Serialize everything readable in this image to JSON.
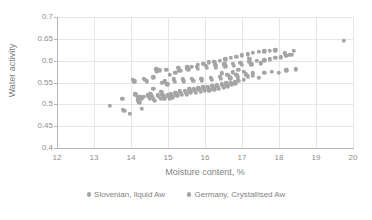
{
  "chart_data": {
    "type": "scatter",
    "title": "",
    "xlabel": "Moisture content, %",
    "ylabel": "Water activity",
    "xlim": [
      12,
      20
    ],
    "ylim": [
      0.4,
      0.7
    ],
    "xticks": [
      12,
      13,
      14,
      15,
      16,
      17,
      18,
      19,
      20
    ],
    "yticks": [
      0.4,
      0.45,
      0.5,
      0.55,
      0.6,
      0.65,
      0.7
    ],
    "xtick_labels": [
      "12",
      "13",
      "14",
      "15",
      "16",
      "17",
      "18",
      "19",
      "20"
    ],
    "ytick_labels": [
      "0.4",
      "0.45",
      "0.5",
      "0.55",
      "0.6",
      "0.65",
      "0.7"
    ],
    "grid": true,
    "grid_axes": "both",
    "legend_position": "bottom",
    "marker_color": "#a5a5a5",
    "marker_size": 4.4,
    "series": [
      {
        "name": "Slovenian, liquid Aw",
        "color": "#a5a5a5",
        "points": [
          [
            13.42,
            0.497
          ],
          [
            13.76,
            0.512
          ],
          [
            13.78,
            0.488
          ],
          [
            13.82,
            0.485
          ],
          [
            13.97,
            0.479
          ],
          [
            14.05,
            0.556
          ],
          [
            14.08,
            0.552
          ],
          [
            14.12,
            0.523
          ],
          [
            14.16,
            0.519
          ],
          [
            14.18,
            0.513
          ],
          [
            14.2,
            0.509
          ],
          [
            14.22,
            0.505
          ],
          [
            14.25,
            0.516
          ],
          [
            14.28,
            0.512
          ],
          [
            14.3,
            0.49
          ],
          [
            14.34,
            0.517
          ],
          [
            14.38,
            0.556
          ],
          [
            14.42,
            0.553
          ],
          [
            14.45,
            0.521
          ],
          [
            14.48,
            0.517
          ],
          [
            14.5,
            0.513
          ],
          [
            14.52,
            0.524
          ],
          [
            14.55,
            0.519
          ],
          [
            14.58,
            0.515
          ],
          [
            14.6,
            0.535
          ],
          [
            14.62,
            0.511
          ],
          [
            14.65,
            0.508
          ],
          [
            14.68,
            0.58
          ],
          [
            14.7,
            0.575
          ],
          [
            14.72,
            0.521
          ],
          [
            14.75,
            0.517
          ],
          [
            14.78,
            0.578
          ],
          [
            14.8,
            0.513
          ],
          [
            14.82,
            0.528
          ],
          [
            14.85,
            0.522
          ],
          [
            14.88,
            0.518
          ],
          [
            14.9,
            0.514
          ],
          [
            14.92,
            0.553
          ],
          [
            14.95,
            0.579
          ],
          [
            14.98,
            0.546
          ],
          [
            15.0,
            0.521
          ],
          [
            15.02,
            0.517
          ],
          [
            15.05,
            0.513
          ],
          [
            15.08,
            0.524
          ],
          [
            15.1,
            0.52
          ],
          [
            15.12,
            0.516
          ],
          [
            15.15,
            0.557
          ],
          [
            15.18,
            0.552
          ],
          [
            15.2,
            0.527
          ],
          [
            15.22,
            0.523
          ],
          [
            15.25,
            0.519
          ],
          [
            15.28,
            0.584
          ],
          [
            15.3,
            0.578
          ],
          [
            15.32,
            0.53
          ],
          [
            15.35,
            0.526
          ],
          [
            15.38,
            0.522
          ],
          [
            15.4,
            0.557
          ],
          [
            15.42,
            0.553
          ],
          [
            15.45,
            0.531
          ],
          [
            15.48,
            0.527
          ],
          [
            15.5,
            0.523
          ],
          [
            15.52,
            0.585
          ],
          [
            15.55,
            0.58
          ],
          [
            15.58,
            0.534
          ],
          [
            15.6,
            0.53
          ],
          [
            15.62,
            0.526
          ],
          [
            15.65,
            0.558
          ],
          [
            15.68,
            0.554
          ],
          [
            15.7,
            0.535
          ],
          [
            15.72,
            0.531
          ],
          [
            15.75,
            0.527
          ],
          [
            15.78,
            0.586
          ],
          [
            15.8,
            0.581
          ],
          [
            15.82,
            0.537
          ],
          [
            15.85,
            0.533
          ],
          [
            15.88,
            0.529
          ],
          [
            15.9,
            0.559
          ],
          [
            15.92,
            0.555
          ],
          [
            15.95,
            0.539
          ],
          [
            15.98,
            0.535
          ],
          [
            16.0,
            0.531
          ],
          [
            16.02,
            0.588
          ],
          [
            16.05,
            0.583
          ],
          [
            16.08,
            0.54
          ],
          [
            16.1,
            0.536
          ],
          [
            16.12,
            0.532
          ],
          [
            16.15,
            0.561
          ],
          [
            16.18,
            0.556
          ],
          [
            16.2,
            0.542
          ],
          [
            16.22,
            0.538
          ],
          [
            16.25,
            0.534
          ],
          [
            16.28,
            0.59
          ],
          [
            16.3,
            0.585
          ],
          [
            16.32,
            0.544
          ],
          [
            16.35,
            0.54
          ],
          [
            16.38,
            0.536
          ],
          [
            16.4,
            0.563
          ],
          [
            16.42,
            0.558
          ],
          [
            16.45,
            0.546
          ],
          [
            16.48,
            0.542
          ],
          [
            16.5,
            0.538
          ],
          [
            16.52,
            0.592
          ],
          [
            16.55,
            0.587
          ],
          [
            16.58,
            0.548
          ],
          [
            16.6,
            0.544
          ],
          [
            16.62,
            0.54
          ],
          [
            16.65,
            0.565
          ],
          [
            16.68,
            0.56
          ],
          [
            16.7,
            0.55
          ],
          [
            16.72,
            0.546
          ],
          [
            16.75,
            0.593
          ],
          [
            16.78,
            0.588
          ],
          [
            16.8,
            0.552
          ],
          [
            16.82,
            0.548
          ],
          [
            16.85,
            0.567
          ],
          [
            16.88,
            0.562
          ],
          [
            16.9,
            0.554
          ],
          [
            16.95,
            0.595
          ],
          [
            17.0,
            0.59
          ],
          [
            17.05,
            0.556
          ],
          [
            17.1,
            0.569
          ],
          [
            17.15,
            0.564
          ],
          [
            17.2,
            0.597
          ],
          [
            17.25,
            0.592
          ],
          [
            17.3,
            0.571
          ],
          [
            17.4,
            0.599
          ],
          [
            17.5,
            0.594
          ],
          [
            17.6,
            0.601
          ],
          [
            17.75,
            0.603
          ],
          [
            17.9,
            0.606
          ],
          [
            18.05,
            0.608
          ],
          [
            18.2,
            0.611
          ],
          [
            18.35,
            0.614
          ],
          [
            19.75,
            0.645
          ]
        ]
      },
      {
        "name": "Germany, Crystallised Aw",
        "color": "#a5a5a5",
        "points": [
          [
            14.1,
            0.553
          ],
          [
            14.35,
            0.558
          ],
          [
            14.6,
            0.562
          ],
          [
            14.85,
            0.549
          ],
          [
            15.05,
            0.567
          ],
          [
            15.2,
            0.572
          ],
          [
            15.35,
            0.577
          ],
          [
            15.5,
            0.582
          ],
          [
            15.65,
            0.586
          ],
          [
            15.8,
            0.59
          ],
          [
            15.95,
            0.593
          ],
          [
            16.1,
            0.596
          ],
          [
            16.25,
            0.598
          ],
          [
            16.4,
            0.6
          ],
          [
            16.55,
            0.603
          ],
          [
            16.7,
            0.606
          ],
          [
            16.85,
            0.609
          ],
          [
            17.0,
            0.612
          ],
          [
            17.15,
            0.615
          ],
          [
            17.3,
            0.618
          ],
          [
            17.45,
            0.62
          ],
          [
            17.6,
            0.621
          ],
          [
            17.75,
            0.623
          ],
          [
            17.9,
            0.624
          ],
          [
            17.3,
            0.566
          ],
          [
            17.45,
            0.561
          ],
          [
            17.6,
            0.572
          ],
          [
            17.8,
            0.575
          ],
          [
            18.0,
            0.572
          ],
          [
            18.2,
            0.578
          ],
          [
            18.45,
            0.58
          ],
          [
            18.15,
            0.617
          ],
          [
            18.3,
            0.613
          ],
          [
            18.4,
            0.622
          ],
          [
            17.2,
            0.604
          ],
          [
            17.05,
            0.575
          ],
          [
            16.9,
            0.579
          ],
          [
            16.75,
            0.573
          ],
          [
            16.6,
            0.568
          ],
          [
            16.45,
            0.571
          ]
        ]
      }
    ]
  },
  "legend": {
    "items": [
      {
        "label": "Slovenian, liquid Aw",
        "color": "#a5a5a5"
      },
      {
        "label": "Germany, Crystallised Aw",
        "color": "#a5a5a5"
      }
    ]
  }
}
